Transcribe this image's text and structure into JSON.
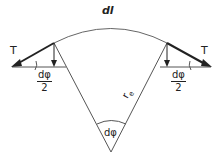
{
  "diagram": {
    "title_label": "dl",
    "force_left_label": "T",
    "force_right_label": "T",
    "half_angle_left": {
      "numerator": "dφ",
      "denominator": "2"
    },
    "half_angle_right": {
      "numerator": "dφ",
      "denominator": "2"
    },
    "radius_label": "r",
    "radius_subscript": "e",
    "center_angle_label": "dφ",
    "colors": {
      "line": "#555555",
      "arrow": "#222222"
    }
  }
}
